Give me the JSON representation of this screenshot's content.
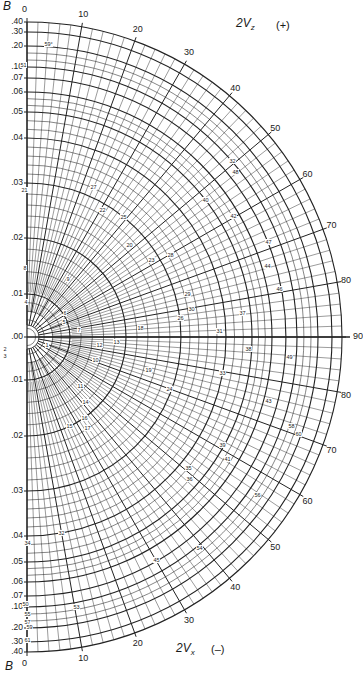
{
  "diagram": {
    "type": "polar-nomogram",
    "center_px": [
      27,
      337
    ],
    "outer_radius_px": 315,
    "b_axis": {
      "label": "B",
      "ticks": [
        {
          "value": ".40",
          "r": 315
        },
        {
          "value": ".30",
          "r": 305
        },
        {
          "value": ".20",
          "r": 291
        },
        {
          "value": ".10",
          "r": 270
        },
        {
          "value": ".07",
          "r": 259
        },
        {
          "value": ".06",
          "r": 245
        },
        {
          "value": ".05",
          "r": 225
        },
        {
          "value": ".04",
          "r": 199
        },
        {
          "value": ".03",
          "r": 154
        },
        {
          "value": ".02",
          "r": 99
        },
        {
          "value": ".01",
          "r": 43
        },
        {
          "value": ".00",
          "r": 0
        }
      ]
    },
    "top_axis": {
      "title_main": "2V",
      "title_sub": "z",
      "sign": "(+)"
    },
    "bottom_axis": {
      "title_main": "2V",
      "title_sub": "x",
      "sign": "(–)"
    },
    "angle_labels": [
      "0",
      "10",
      "20",
      "30",
      "40",
      "50",
      "60",
      "70",
      "80",
      "90"
    ],
    "angle_labels_bottom": [
      "0",
      "10",
      "20",
      "30",
      "40",
      "50",
      "60",
      "70",
      "80"
    ],
    "center_label": "90",
    "point_labels": [
      {
        "t": "59°",
        "x": 44,
        "y": 44
      },
      {
        "t": "51",
        "x": 20,
        "y": 65
      },
      {
        "t": "21",
        "x": 21,
        "y": 190
      },
      {
        "t": "27",
        "x": 90,
        "y": 187
      },
      {
        "t": "22",
        "x": 99,
        "y": 210
      },
      {
        "t": "25",
        "x": 120,
        "y": 217
      },
      {
        "t": "20",
        "x": 126,
        "y": 245
      },
      {
        "t": "23",
        "x": 148,
        "y": 260
      },
      {
        "t": "28",
        "x": 167,
        "y": 255
      },
      {
        "t": "40",
        "x": 202,
        "y": 200
      },
      {
        "t": "32",
        "x": 229,
        "y": 161
      },
      {
        "t": "48",
        "x": 232,
        "y": 172
      },
      {
        "t": "42",
        "x": 230,
        "y": 216
      },
      {
        "t": "47",
        "x": 265,
        "y": 242
      },
      {
        "t": "44",
        "x": 264,
        "y": 266
      },
      {
        "t": "46",
        "x": 276,
        "y": 289
      },
      {
        "t": "8",
        "x": 23,
        "y": 268
      },
      {
        "t": "9",
        "x": 66,
        "y": 279
      },
      {
        "t": "4",
        "x": 24,
        "y": 302
      },
      {
        "t": "6",
        "x": 63,
        "y": 313
      },
      {
        "t": "5",
        "x": 62,
        "y": 322
      },
      {
        "t": "7",
        "x": 77,
        "y": 330
      },
      {
        "t": "29",
        "x": 184,
        "y": 294
      },
      {
        "t": "30",
        "x": 188,
        "y": 309
      },
      {
        "t": "26",
        "x": 177,
        "y": 318
      },
      {
        "t": "37",
        "x": 239,
        "y": 313
      },
      {
        "t": "18",
        "x": 137,
        "y": 328
      },
      {
        "t": "31",
        "x": 216,
        "y": 331
      },
      {
        "t": "1",
        "x": 45,
        "y": 345
      },
      {
        "t": "12",
        "x": 96,
        "y": 345
      },
      {
        "t": "13",
        "x": 113,
        "y": 342
      },
      {
        "t": "10",
        "x": 92,
        "y": 360
      },
      {
        "t": "19",
        "x": 145,
        "y": 370
      },
      {
        "t": "38",
        "x": 245,
        "y": 349
      },
      {
        "t": "49",
        "x": 286,
        "y": 357
      },
      {
        "t": "33",
        "x": 219,
        "y": 373
      },
      {
        "t": "24",
        "x": 166,
        "y": 389
      },
      {
        "t": "11",
        "x": 77,
        "y": 386
      },
      {
        "t": "14",
        "x": 82,
        "y": 402
      },
      {
        "t": "16",
        "x": 81,
        "y": 418
      },
      {
        "t": "15",
        "x": 66,
        "y": 426
      },
      {
        "t": "17",
        "x": 84,
        "y": 428
      },
      {
        "t": "43",
        "x": 265,
        "y": 401
      },
      {
        "t": "58",
        "x": 288,
        "y": 426
      },
      {
        "t": "60",
        "x": 295,
        "y": 434
      },
      {
        "t": "39",
        "x": 219,
        "y": 445
      },
      {
        "t": "41",
        "x": 224,
        "y": 459
      },
      {
        "t": "35",
        "x": 185,
        "y": 468
      },
      {
        "t": "36",
        "x": 186,
        "y": 479
      },
      {
        "t": "56",
        "x": 254,
        "y": 495
      },
      {
        "t": "32",
        "x": 58,
        "y": 533
      },
      {
        "t": "34",
        "x": 24,
        "y": 543
      },
      {
        "t": "54",
        "x": 196,
        "y": 548
      },
      {
        "t": "45",
        "x": 153,
        "y": 560
      },
      {
        "t": "50",
        "x": 22,
        "y": 604
      },
      {
        "t": "55",
        "x": 24,
        "y": 614
      },
      {
        "t": "53",
        "x": 73,
        "y": 607
      },
      {
        "t": "57",
        "x": 24,
        "y": 622
      },
      {
        "t": "59",
        "x": 26,
        "y": 627
      },
      {
        "t": "61",
        "x": 24,
        "y": 640
      },
      {
        "t": "2",
        "x": 3,
        "y": 349
      },
      {
        "t": "3",
        "x": 3,
        "y": 356
      }
    ]
  }
}
